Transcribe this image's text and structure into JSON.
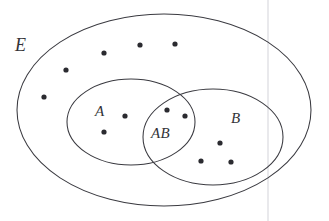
{
  "figure": {
    "kind": "venn-diagram",
    "background_color": "#ffffff",
    "stroke_color": "#3a3a40",
    "dot_color": "#2b2b30",
    "label_color": "#333338",
    "width": 329,
    "height": 221
  },
  "labels": {
    "universe": "E",
    "set_a": "A",
    "set_b": "B",
    "intersection": "AB"
  },
  "sets": [
    {
      "name": "universe-ellipse",
      "label": "E",
      "cx": 164,
      "cy": 110,
      "rx": 147,
      "ry": 96,
      "rotation": 0
    },
    {
      "name": "set-a-ellipse",
      "label": "A",
      "cx": 131,
      "cy": 122,
      "rx": 64,
      "ry": 43,
      "rotation": 0
    },
    {
      "name": "set-b-ellipse",
      "label": "B",
      "cx": 213,
      "cy": 137,
      "rx": 70,
      "ry": 48,
      "rotation": 0
    }
  ],
  "elements": {
    "universe_only": [
      {
        "x": 104,
        "y": 53
      },
      {
        "x": 140,
        "y": 45
      },
      {
        "x": 175,
        "y": 44
      },
      {
        "x": 66,
        "y": 70
      },
      {
        "x": 44,
        "y": 97
      }
    ],
    "set_a_only": [
      {
        "x": 125,
        "y": 116
      },
      {
        "x": 104,
        "y": 132
      }
    ],
    "intersection_ab": [
      {
        "x": 167,
        "y": 110
      },
      {
        "x": 185,
        "y": 116
      }
    ],
    "set_b_only": [
      {
        "x": 220,
        "y": 143
      },
      {
        "x": 201,
        "y": 161
      },
      {
        "x": 231,
        "y": 162
      }
    ]
  },
  "counts": {
    "universe_only": 5,
    "set_a_only": 2,
    "intersection_ab": 2,
    "set_b_only": 3,
    "total": 12
  },
  "dot_radius": 2.6,
  "artifacts": {
    "scan_line_x": 268,
    "scan_line_color": "#e9e9ec"
  }
}
